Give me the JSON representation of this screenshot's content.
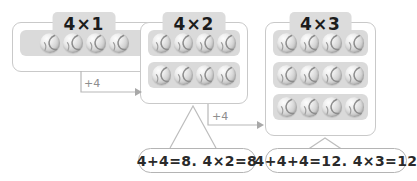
{
  "canvas": {
    "width": 417,
    "height": 181,
    "background": "#ffffff"
  },
  "theme": {
    "card_border": "#c9c9c9",
    "badge_background": "#dcdcdc",
    "tray_background": "#dadada",
    "ball_color": "#cccccc",
    "connector_color": "#b0b0b0",
    "pill_border": "#b4b4b4",
    "text_color": "#1c1c1c",
    "muted_text_color": "#8e8e8e"
  },
  "groups": [
    {
      "id": "group-1",
      "label": "4×1",
      "rows": 1,
      "columns": 4,
      "total": 4,
      "ball_icon": "ball-icon"
    },
    {
      "id": "group-2",
      "label": "4×2",
      "rows": 2,
      "columns": 4,
      "total": 8,
      "ball_icon": "ball-icon"
    },
    {
      "id": "group-3",
      "label": "4×3",
      "rows": 3,
      "columns": 4,
      "total": 12,
      "ball_icon": "ball-icon"
    }
  ],
  "connectors": [
    {
      "id": "connector-1",
      "label": "+4",
      "from": "group-1",
      "to": "group-2",
      "arrow_icon": "arrow-right-icon"
    },
    {
      "id": "connector-2",
      "label": "+4",
      "from": "group-2",
      "to": "group-3",
      "arrow_icon": "arrow-right-icon"
    }
  ],
  "equations": [
    {
      "id": "equation-1",
      "for_group": "group-2",
      "text": "4+4=8. 4×2=8",
      "addition": "4+4=8",
      "multiplication": "4×2=8",
      "sum": 8
    },
    {
      "id": "equation-2",
      "for_group": "group-3",
      "text": "4+4+4=12. 4×3=12",
      "addition": "4+4+4=12",
      "multiplication": "4×3=12",
      "sum": 12
    }
  ]
}
